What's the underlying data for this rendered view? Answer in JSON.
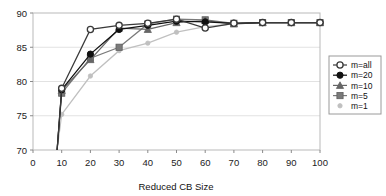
{
  "chart_data": {
    "type": "line",
    "title": "",
    "subtitle": "",
    "xlabel": "Reduced CB Size",
    "ylabel": "",
    "xlim": [
      0,
      100
    ],
    "ylim": [
      70,
      90
    ],
    "xticks": [
      0,
      10,
      20,
      30,
      40,
      50,
      60,
      70,
      80,
      90,
      100
    ],
    "yticks": [
      70,
      75,
      80,
      85,
      90
    ],
    "xtick_labels": [
      "0",
      "10",
      "20",
      "30",
      "40",
      "50",
      "60",
      "70",
      "80",
      "90",
      "100"
    ],
    "ytick_labels": [
      "70",
      "75",
      "80",
      "85",
      "90"
    ],
    "grid": true,
    "grid_axis": "y",
    "legend_position": "right",
    "x": [
      10,
      20,
      30,
      40,
      50,
      60,
      70,
      80,
      90,
      100
    ],
    "series": [
      {
        "name": "m=all",
        "marker": "open-circle",
        "color": "#3a3a3a",
        "values": [
          79.0,
          87.6,
          88.2,
          88.5,
          89.1,
          87.8,
          88.5,
          88.6,
          88.6,
          88.6
        ]
      },
      {
        "name": "m=20",
        "marker": "filled-circle",
        "color": "#111111",
        "values": [
          78.8,
          84.0,
          87.6,
          88.2,
          88.8,
          88.7,
          88.5,
          88.6,
          88.6,
          88.6
        ]
      },
      {
        "name": "m=10",
        "marker": "triangle",
        "color": "#666666",
        "values": [
          78.7,
          83.2,
          87.8,
          87.6,
          88.6,
          88.9,
          88.4,
          88.6,
          88.6,
          88.6
        ]
      },
      {
        "name": "m=5",
        "marker": "filled-square",
        "color": "#7a7a7a",
        "values": [
          78.3,
          83.4,
          85.0,
          88.4,
          89.1,
          89.0,
          88.5,
          88.6,
          88.6,
          88.6
        ]
      },
      {
        "name": "m=1",
        "marker": "small-diamond",
        "color": "#c0c0c0",
        "values": [
          75.2,
          80.8,
          84.5,
          85.6,
          87.2,
          88.0,
          88.4,
          88.6,
          88.6,
          88.6
        ]
      }
    ]
  },
  "legend": {
    "entries": [
      {
        "label": "m=all"
      },
      {
        "label": "m=20"
      },
      {
        "label": "m=10"
      },
      {
        "label": "m=5"
      },
      {
        "label": "m=1"
      }
    ]
  }
}
